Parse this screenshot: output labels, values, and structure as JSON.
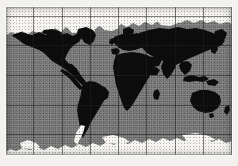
{
  "figure": {
    "kind": "world-map",
    "projection": "equirectangular",
    "style": "grayscale scanned raster"
  },
  "colors": {
    "page_background": "#f2f1ee",
    "frame": "#fbfaf8",
    "ocean": "#7e7e7e",
    "land": "#0d0d0d",
    "ice": "#f6f5f1",
    "graticule": "#1e1e1e"
  },
  "graticule": {
    "visible": true,
    "meridian_spacing_px": 28.3,
    "parallel_spacing_px": 29.7,
    "meridian_count": 8,
    "parallel_count": 5,
    "line_style": "solid thin dark"
  },
  "features": [
    {
      "name": "arctic-ice-cap",
      "type": "ice",
      "label": "Arctic sea ice / polar snow"
    },
    {
      "name": "antarctica",
      "type": "ice",
      "label": "Antarctica"
    },
    {
      "name": "antarctic-peninsula",
      "type": "ice",
      "label": "Antarctic Peninsula"
    },
    {
      "name": "north-america",
      "type": "land",
      "label": "North America"
    },
    {
      "name": "greenland",
      "type": "land",
      "label": "Greenland"
    },
    {
      "name": "south-america",
      "type": "land",
      "label": "South America"
    },
    {
      "name": "europe",
      "type": "land",
      "label": "Europe"
    },
    {
      "name": "africa",
      "type": "land",
      "label": "Africa"
    },
    {
      "name": "asia",
      "type": "land",
      "label": "Asia"
    },
    {
      "name": "australia",
      "type": "land",
      "label": "Australia"
    },
    {
      "name": "new-zealand",
      "type": "land",
      "label": "New Zealand"
    },
    {
      "name": "madagascar",
      "type": "land",
      "label": "Madagascar"
    },
    {
      "name": "japan",
      "type": "land",
      "label": "Japan"
    },
    {
      "name": "indonesia",
      "type": "land",
      "label": "Indonesian archipelago"
    },
    {
      "name": "british-isles",
      "type": "land",
      "label": "British Isles"
    }
  ],
  "labels": {
    "none_visible": ""
  }
}
